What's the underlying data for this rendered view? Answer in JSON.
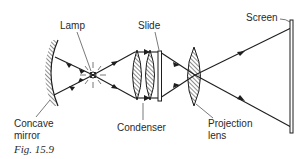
{
  "figure": {
    "caption": "Fig. 15.9"
  },
  "labels": {
    "lamp": "Lamp",
    "slide": "Slide",
    "screen": "Screen",
    "concave_mirror_line1": "Concave",
    "concave_mirror_line2": "mirror",
    "condenser": "Condenser",
    "projection_lens_line1": "Projection",
    "projection_lens_line2": "lens"
  },
  "components": [
    {
      "id": "concave-mirror",
      "label": "Concave mirror"
    },
    {
      "id": "lamp",
      "label": "Lamp"
    },
    {
      "id": "condenser",
      "label": "Condenser",
      "lens_count": 2
    },
    {
      "id": "slide",
      "label": "Slide"
    },
    {
      "id": "projection-lens",
      "label": "Projection lens"
    },
    {
      "id": "screen",
      "label": "Screen"
    }
  ],
  "colors": {
    "line": "#1e1e1e",
    "text": "#2a2a2a",
    "background": "#ffffff"
  }
}
